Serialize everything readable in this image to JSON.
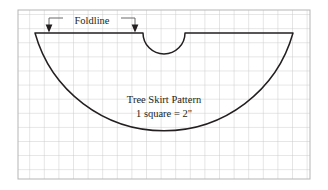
{
  "figure": {
    "kind": "sewing-pattern-diagram",
    "title_line_1": "Tree Skirt Pattern",
    "title_line_2": "1 square = 2\"",
    "foldline_label": "Foldline",
    "scale_note": "1 square = 2 inches",
    "colors": {
      "grid_line": "#c9c9c9",
      "grid_border": "#b5b5b5",
      "pattern_outline": "#231f20",
      "text": "#231f20",
      "leader_line": "#4d4d4d",
      "background": "#ffffff"
    },
    "grid": {
      "left": 18,
      "top": 10,
      "right": 310,
      "bottom": 179,
      "cell_width": 14.6,
      "cell_height": 14.1,
      "columns": 20,
      "rows": 12
    },
    "pattern_shape": {
      "type": "half-circle-with-center-notch",
      "left_vertex_x": 35,
      "right_vertex_x": 293,
      "top_edge_y": 33,
      "arc_bottom_y": 167,
      "notch_center_x": 164,
      "notch_radius": 21
    },
    "foldline_markers": [
      {
        "name": "left-fold-arrow",
        "x": 49,
        "tip_y": 32
      },
      {
        "name": "right-fold-arrow",
        "x": 135,
        "tip_y": 32
      }
    ]
  }
}
